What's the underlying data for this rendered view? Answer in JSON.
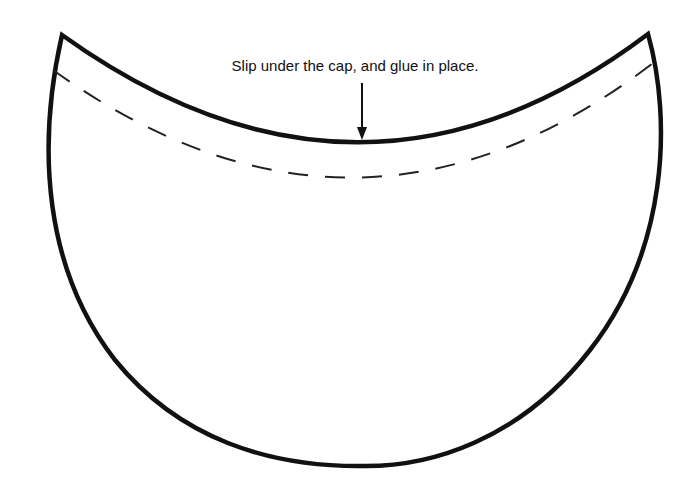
{
  "diagram": {
    "type": "papercraft cutout template",
    "shape": "crescent / curved band piece",
    "instruction": "Slip under the cap, and glue in place.",
    "colors": {
      "outline": "#111111",
      "dashed_fold_line": "#222222",
      "background": "#ffffff"
    },
    "elements": {
      "outline": "solid thick cut line",
      "fold_line": "dashed glue/tuck line",
      "arrow": "down arrow pointing to top edge"
    }
  }
}
